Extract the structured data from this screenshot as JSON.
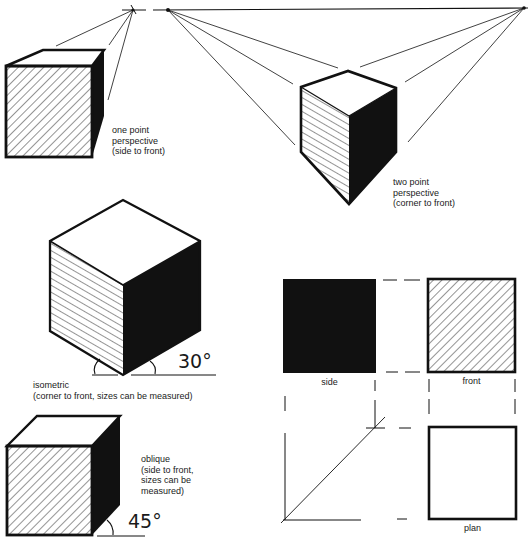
{
  "colors": {
    "ink": "#111111",
    "paper": "#ffffff"
  },
  "drawings": {
    "one_point": {
      "label_lines": [
        "one point",
        "perspective",
        "(side to front)"
      ]
    },
    "two_point": {
      "label_lines": [
        "two point",
        "perspective",
        "(corner to front)"
      ]
    },
    "isometric": {
      "label_lines": [
        "isometric",
        "(corner to front, sizes can be measured)"
      ],
      "angle": "30°"
    },
    "oblique": {
      "label_lines": [
        "oblique",
        "(side to front,",
        "sizes can be",
        "measured)"
      ],
      "angle": "45°"
    },
    "orthographic": {
      "views": [
        {
          "name": "side",
          "fill": "solid"
        },
        {
          "name": "front",
          "fill": "hatched"
        },
        {
          "name": "plan",
          "fill": "blank"
        }
      ]
    }
  }
}
